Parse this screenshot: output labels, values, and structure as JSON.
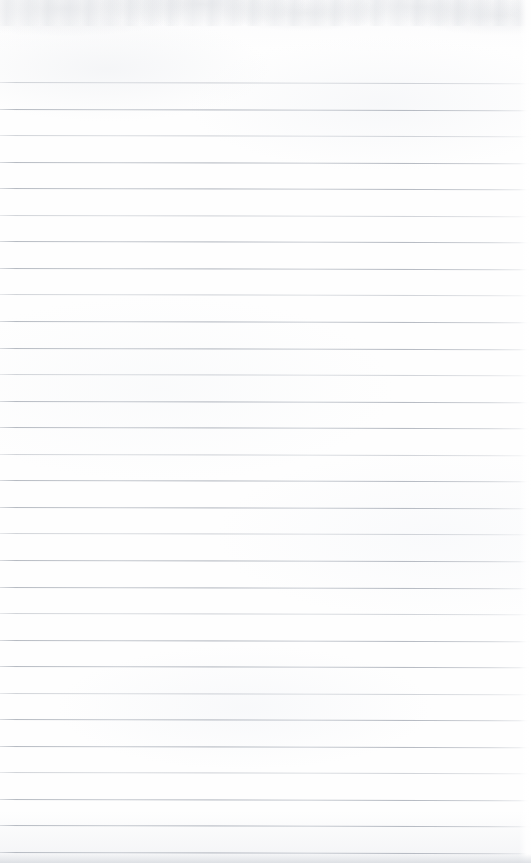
{
  "document": {
    "kind": "scanned-lined-notebook-page",
    "title": "Blank ruled notebook page",
    "content_text": "",
    "page_width_px": 531,
    "page_height_px": 863,
    "orientation": "portrait"
  },
  "appearance": {
    "paper_color": "#fdfdfd",
    "rule_color": "#b4b9c1",
    "rule_color_dark": "#acb1ba",
    "edge_shadow_color": "#d6d9de",
    "top_noise_color": "#d0d4da"
  },
  "ruling": {
    "style": "wide-ruled",
    "first_line_y": 82,
    "line_spacing_px": 26.55,
    "line_thickness_px": 1,
    "line_count": 30,
    "left_margin_rule": false,
    "right_margin_rule": false,
    "header_blank_height_px": 82,
    "lines_y": [
      82.0,
      108.6,
      135.1,
      161.7,
      188.2,
      214.8,
      241.3,
      267.9,
      294.4,
      321.0,
      347.5,
      374.1,
      400.6,
      427.2,
      453.7,
      480.3,
      506.8,
      533.4,
      559.9,
      586.5,
      613.0,
      639.6,
      666.1,
      692.7,
      719.2,
      745.8,
      772.3,
      798.9,
      825.4,
      852.0
    ],
    "line_weights": [
      "faint",
      "strong",
      "faint",
      "strong",
      "strong",
      "faint",
      "strong",
      "strong",
      "faint",
      "strong",
      "strong",
      "faint",
      "strong",
      "strong",
      "faint",
      "strong",
      "strong",
      "faint",
      "strong",
      "strong",
      "faint",
      "strong",
      "strong",
      "faint",
      "strong",
      "strong",
      "faint",
      "strong",
      "strong",
      "strong"
    ]
  },
  "annotations": {
    "handwriting_present": false,
    "printed_text_present": false,
    "notes": ""
  }
}
